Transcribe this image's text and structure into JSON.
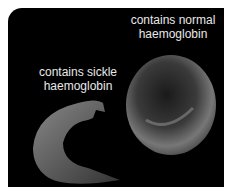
{
  "image": {
    "background": "#000000",
    "labels": {
      "normal": [
        "contains normal",
        "haemoglobin"
      ],
      "sickle": [
        "contains sickle",
        "haemoglobin"
      ]
    },
    "cells": [
      {
        "type": "normal red blood cell",
        "shape": "round biconcave disc"
      },
      {
        "type": "sickle cell",
        "shape": "crescent"
      }
    ]
  }
}
